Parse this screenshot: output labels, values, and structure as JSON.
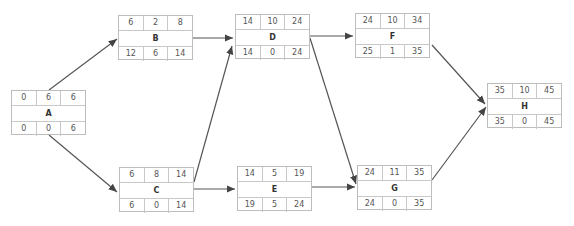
{
  "diagram": {
    "type": "activity-on-node network (CPM)",
    "nodes": {
      "A": {
        "name": "A",
        "es": "0",
        "dur": "6",
        "ef": "6",
        "ls": "0",
        "slack": "0",
        "lf": "6"
      },
      "B": {
        "name": "B",
        "es": "6",
        "dur": "2",
        "ef": "8",
        "ls": "12",
        "slack": "6",
        "lf": "14"
      },
      "C": {
        "name": "C",
        "es": "6",
        "dur": "8",
        "ef": "14",
        "ls": "6",
        "slack": "0",
        "lf": "14"
      },
      "D": {
        "name": "D",
        "es": "14",
        "dur": "10",
        "ef": "24",
        "ls": "14",
        "slack": "0",
        "lf": "24"
      },
      "E": {
        "name": "E",
        "es": "14",
        "dur": "5",
        "ef": "19",
        "ls": "19",
        "slack": "5",
        "lf": "24"
      },
      "F": {
        "name": "F",
        "es": "24",
        "dur": "10",
        "ef": "34",
        "ls": "25",
        "slack": "1",
        "lf": "35"
      },
      "G": {
        "name": "G",
        "es": "24",
        "dur": "11",
        "ef": "35",
        "ls": "24",
        "slack": "0",
        "lf": "35"
      },
      "H": {
        "name": "H",
        "es": "35",
        "dur": "10",
        "ef": "45",
        "ls": "35",
        "slack": "0",
        "lf": "45"
      }
    },
    "edges": [
      [
        "A",
        "B"
      ],
      [
        "A",
        "C"
      ],
      [
        "B",
        "D"
      ],
      [
        "C",
        "D"
      ],
      [
        "C",
        "E"
      ],
      [
        "D",
        "F"
      ],
      [
        "D",
        "G"
      ],
      [
        "E",
        "G"
      ],
      [
        "F",
        "H"
      ],
      [
        "G",
        "H"
      ]
    ],
    "colors": {
      "edge": "#444444",
      "node_border": "#bdbdbd",
      "text": "#555555"
    }
  }
}
